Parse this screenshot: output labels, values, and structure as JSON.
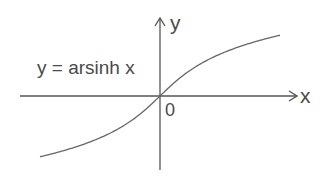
{
  "figure": {
    "function_label": "y = arsinh x",
    "x_axis_label": "x",
    "y_axis_label": "y",
    "origin_label": "0",
    "colors": {
      "axis": "#555555",
      "curve": "#666666",
      "text": "#4a4a4a",
      "background": "#ffffff"
    }
  },
  "chart_data": {
    "type": "line",
    "title": "y = arsinh x",
    "xlabel": "x",
    "ylabel": "y",
    "annotations": [
      "y = arsinh x",
      "0"
    ],
    "grid": false,
    "legend": "none",
    "axis_ticks": "none (only origin labeled 0)",
    "series": [
      {
        "name": "arsinh x",
        "x": [
          -4,
          -3,
          -2,
          -1.5,
          -1,
          -0.5,
          0,
          0.5,
          1,
          1.5,
          2,
          3,
          4
        ],
        "y": [
          -2.095,
          -1.818,
          -1.444,
          -1.195,
          -0.881,
          -0.481,
          0,
          0.481,
          0.881,
          1.195,
          1.444,
          1.818,
          2.095
        ]
      }
    ],
    "xlim": [
      -4.5,
      4.5
    ],
    "ylim": [
      -2.5,
      2.5
    ]
  }
}
